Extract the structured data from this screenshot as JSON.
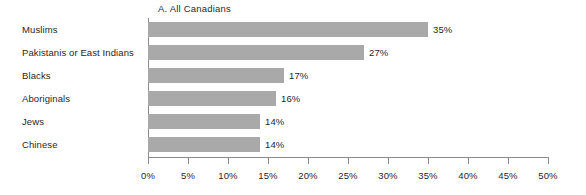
{
  "chart_data": {
    "type": "bar",
    "orientation": "horizontal",
    "title": "A.  All Canadians",
    "xlabel": "",
    "ylabel": "",
    "xlim": [
      0,
      50
    ],
    "grid": false,
    "legend": null,
    "bar_color": "#a9a9a9",
    "axis_color": "#8a8a8a",
    "text_color": "#1f1f1f",
    "categories": [
      "Muslims",
      "Pakistanis or East Indians",
      "Blacks",
      "Aboriginals",
      "Jews",
      "Chinese"
    ],
    "values": [
      35,
      27,
      17,
      16,
      14,
      14
    ],
    "data_labels": [
      "35%",
      "27%",
      "17%",
      "16%",
      "14%",
      "14%"
    ],
    "x_tick_values": [
      0,
      5,
      10,
      15,
      20,
      25,
      30,
      35,
      40,
      45,
      50
    ],
    "x_tick_labels": [
      "0%",
      "5%",
      "10%",
      "15%",
      "20%",
      "25%",
      "30%",
      "35%",
      "40%",
      "45%",
      "50%"
    ]
  }
}
